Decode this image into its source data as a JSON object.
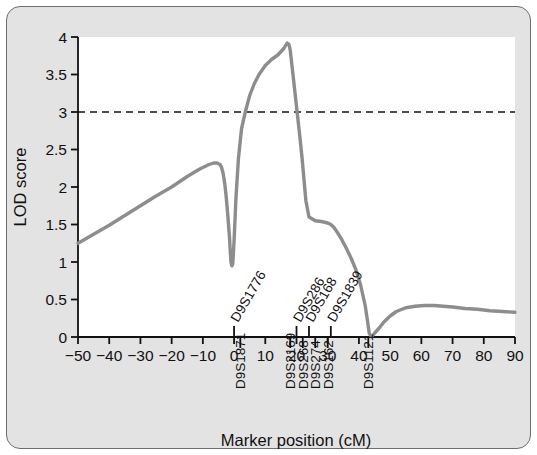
{
  "chart_data": {
    "type": "line",
    "title": "",
    "xlabel": "Marker position (cM)",
    "ylabel": "LOD score",
    "xlim": [
      -50,
      90
    ],
    "ylim": [
      0,
      4
    ],
    "xticks": [
      -50,
      -40,
      -30,
      -20,
      -10,
      0,
      10,
      20,
      30,
      40,
      50,
      60,
      70,
      80,
      90
    ],
    "xtick_labels": [
      "−50",
      "−40",
      "−30",
      "−20",
      "−10",
      "0",
      "10",
      "20",
      "30",
      "40",
      "50",
      "60",
      "70",
      "80",
      "90"
    ],
    "yticks": [
      0,
      0.5,
      1,
      1.5,
      2,
      2.5,
      3,
      3.5,
      4
    ],
    "ytick_labels": [
      "0",
      "0.5",
      "1",
      "1.5",
      "2",
      "2.5",
      "3",
      "3.5",
      "4"
    ],
    "grid": false,
    "legend": null,
    "line_color": "#8d8d8d",
    "threshold_line": {
      "value": 3,
      "style": "dashed",
      "color": "#111111"
    },
    "series": [
      {
        "name": "LOD score",
        "x": [
          -50,
          -45,
          -40,
          -35,
          -30,
          -25,
          -20,
          -15,
          -11,
          -8,
          -6.5,
          -5.5,
          -4.5,
          -4,
          -3.5,
          -3,
          -2.5,
          -2,
          -1.5,
          -1.2,
          -1,
          -0.7,
          -0.4,
          0,
          0.6,
          1.4,
          2.4,
          3.6,
          5,
          6.5,
          8,
          10,
          12,
          14,
          16,
          17,
          17.6,
          18,
          18.6,
          19.4,
          20.2,
          21,
          21.8,
          22.4,
          23,
          24,
          26,
          28,
          30,
          31,
          32,
          33,
          34.5,
          36,
          37.5,
          39,
          40.5,
          42,
          42.8,
          43.3,
          44,
          45,
          46.5,
          48,
          50,
          52,
          55,
          58,
          61,
          64,
          67,
          70,
          74,
          78,
          82,
          86,
          90
        ],
        "y": [
          1.25,
          1.37,
          1.49,
          1.62,
          1.75,
          1.88,
          2.0,
          2.14,
          2.24,
          2.3,
          2.32,
          2.32,
          2.3,
          2.26,
          2.18,
          2.05,
          1.86,
          1.62,
          1.35,
          1.13,
          1.0,
          0.95,
          0.98,
          1.28,
          1.85,
          2.38,
          2.78,
          3.0,
          3.22,
          3.38,
          3.5,
          3.62,
          3.7,
          3.76,
          3.85,
          3.92,
          3.9,
          3.82,
          3.6,
          3.3,
          3.0,
          2.7,
          2.38,
          2.1,
          1.82,
          1.6,
          1.55,
          1.54,
          1.52,
          1.5,
          1.46,
          1.4,
          1.3,
          1.18,
          1.05,
          0.9,
          0.7,
          0.42,
          0.2,
          0.05,
          0.0,
          0.05,
          0.12,
          0.2,
          0.28,
          0.34,
          0.39,
          0.41,
          0.42,
          0.42,
          0.41,
          0.4,
          0.38,
          0.37,
          0.35,
          0.34,
          0.33
        ]
      }
    ],
    "markers_above_axis": [
      {
        "label": "D9S1776",
        "position": 0
      },
      {
        "label": "D9S286",
        "position": 20
      },
      {
        "label": "D9S168",
        "position": 24
      },
      {
        "label": "D9S1839",
        "position": 31
      }
    ],
    "markers_below_axis": [
      {
        "label": "D9S1871",
        "position": 2
      },
      {
        "label": "D9S2169",
        "position": 18
      },
      {
        "label": "D9S268",
        "position": 22
      },
      {
        "label": "D9S274",
        "position": 26
      },
      {
        "label": "D9S162",
        "position": 30
      },
      {
        "label": "D9S1121",
        "position": 43
      }
    ]
  }
}
